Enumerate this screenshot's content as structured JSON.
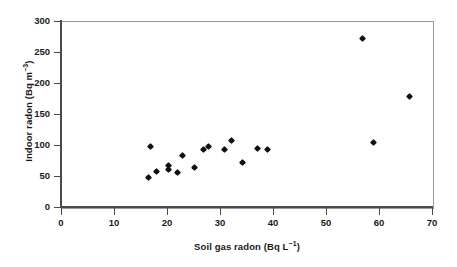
{
  "chart_data": {
    "type": "scatter",
    "title": "",
    "xlabel": "Soil gas radon (Bq L⁻¹)",
    "xlabel_main": "Soil gas radon (Bq L",
    "xlabel_sup": "−1",
    "xlabel_end": ")",
    "ylabel": "Indoor radon (Bq m⁻³)",
    "ylabel_main": "Indoor radon (Bq m",
    "ylabel_sup": "−3",
    "ylabel_end": ")",
    "xlim": [
      0,
      70
    ],
    "ylim": [
      0,
      300
    ],
    "xticks": [
      0,
      10,
      20,
      30,
      40,
      50,
      60,
      70
    ],
    "yticks": [
      0,
      50,
      100,
      150,
      200,
      250,
      300
    ],
    "xtick_labels": [
      "0",
      "10",
      "20",
      "30",
      "40",
      "50",
      "60",
      "70"
    ],
    "ytick_labels": [
      "0",
      "50",
      "100",
      "150",
      "200",
      "250",
      "300"
    ],
    "grid": false,
    "legend": null,
    "marker": "diamond",
    "marker_color": "#111111",
    "frame_color": "#9a9a9a",
    "axis_color": "#4a4a4a",
    "background": "#ffffff",
    "series": [
      {
        "name": "Paired soil gas / indoor radon measurements",
        "points": [
          {
            "x": 16.8,
            "y": 97
          },
          {
            "x": 16.6,
            "y": 48
          },
          {
            "x": 18.1,
            "y": 58
          },
          {
            "x": 20.2,
            "y": 67
          },
          {
            "x": 20.2,
            "y": 61
          },
          {
            "x": 21.9,
            "y": 56
          },
          {
            "x": 23.0,
            "y": 83
          },
          {
            "x": 25.1,
            "y": 64
          },
          {
            "x": 26.8,
            "y": 93
          },
          {
            "x": 27.9,
            "y": 98
          },
          {
            "x": 30.9,
            "y": 92
          },
          {
            "x": 32.1,
            "y": 107
          },
          {
            "x": 34.2,
            "y": 71
          },
          {
            "x": 37.0,
            "y": 95
          },
          {
            "x": 39.0,
            "y": 93
          },
          {
            "x": 56.8,
            "y": 271
          },
          {
            "x": 58.9,
            "y": 104
          },
          {
            "x": 65.8,
            "y": 178
          }
        ]
      }
    ]
  }
}
